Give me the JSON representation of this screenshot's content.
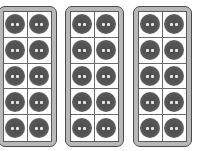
{
  "diagram": {
    "type": "ten-frames",
    "frames": [
      {
        "id": "frame-1",
        "rows": 5,
        "columns": 2,
        "filled": 10,
        "left": -2
      },
      {
        "id": "frame-2",
        "rows": 5,
        "columns": 2,
        "filled": 10,
        "left": 65
      },
      {
        "id": "frame-3",
        "rows": 5,
        "columns": 2,
        "filled": 10,
        "left": 133
      }
    ],
    "total_counters": 30,
    "colors": {
      "frame_border": "#4a4a4a",
      "frame_band": "#b8b8b8",
      "cell_background": "#ffffff",
      "counter": "#555555",
      "counter_holes": "#e8e8e8"
    }
  }
}
